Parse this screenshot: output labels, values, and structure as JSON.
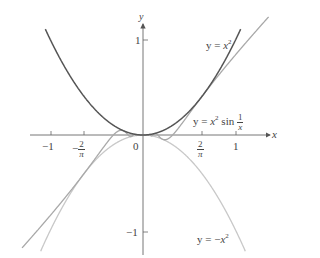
{
  "chart_data": {
    "type": "line",
    "title": "",
    "xlabel": "x",
    "ylabel": "y",
    "xlim": [
      -1.55,
      1.35
    ],
    "ylim": [
      -1.25,
      1.2
    ],
    "grid": false,
    "x_ticks": [
      {
        "value": -1,
        "label": "−1"
      },
      {
        "value": -0.6366,
        "label": "−2/π",
        "minus": "−",
        "num": "2",
        "den": "π"
      },
      {
        "value": 0,
        "label": "0"
      },
      {
        "value": 0.6366,
        "label": "2/π",
        "num": "2",
        "den": "π"
      },
      {
        "value": 1,
        "label": "1"
      }
    ],
    "y_ticks": [
      {
        "value": 1,
        "label": "1"
      },
      {
        "value": -1,
        "label": "−1"
      }
    ],
    "series": [
      {
        "name": "y = x^2",
        "function": "x^2",
        "color": "#555555",
        "domain": [
          -1.05,
          1.05
        ]
      },
      {
        "name": "y = -x^2",
        "function": "-x^2",
        "color": "#c8c8c8",
        "domain": [
          -1.1,
          1.1
        ]
      },
      {
        "name": "y = x^2 sin(1/x)",
        "function": "x^2*sin(1/x)",
        "color": "#a8a8a8",
        "domain": [
          -1.3,
          1.35
        ]
      }
    ],
    "annotations": [
      {
        "text": "y = x²",
        "x": 1.05,
        "y": 0.98
      },
      {
        "text": "y = x² sin(1/x)",
        "x": 0.65,
        "y": 0.15
      },
      {
        "text": "y = −x²",
        "x": 0.6,
        "y": -1.15
      }
    ]
  },
  "labels": {
    "x_axis": "x",
    "y_axis": "y",
    "tick_neg1": "−1",
    "tick_neg2pi_minus": "−",
    "tick_2": "2",
    "tick_pi": "π",
    "tick_zero": "0",
    "tick_1": "1",
    "ytick_1": "1",
    "ytick_neg1": "−1",
    "ann_x2_prefix": "y = ",
    "ann_x2_var": "x",
    "ann_x2_exp": "2",
    "ann_sin_prefix": "y = ",
    "ann_sin_var": "x",
    "ann_sin_exp": "2",
    "ann_sin_fn": " sin ",
    "ann_sin_num": "1",
    "ann_sin_den": "x",
    "ann_neg_prefix": "y = −",
    "ann_neg_var": "x",
    "ann_neg_exp": "2"
  }
}
